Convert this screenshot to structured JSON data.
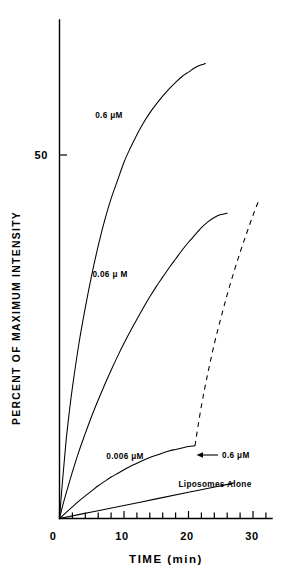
{
  "chart_data": {
    "type": "line",
    "title": "",
    "xlabel": "TIME (min)",
    "ylabel": "PERCENT OF MAXIMUM INTENSITY",
    "xlim": [
      0,
      31
    ],
    "ylim": [
      0,
      68
    ],
    "grid": false,
    "legend_position": "inline-annotations",
    "x_ticks_major": [
      0,
      10,
      20,
      30
    ],
    "x_tick_labels": [
      "0",
      "10",
      "20",
      "30"
    ],
    "x_tick_minor_step": 2,
    "y_ticks_major": [
      50
    ],
    "y_tick_labels": [
      "50"
    ],
    "series": [
      {
        "name": "0.6 uM",
        "label": "0.6 μM",
        "style": "solid",
        "x": [
          0,
          0.5,
          1,
          1.5,
          2,
          3,
          4,
          5,
          6,
          7,
          8,
          9,
          10,
          11,
          12,
          13,
          14,
          15,
          16,
          17,
          18,
          19,
          20,
          21,
          22,
          22.6
        ],
        "y": [
          0,
          5.5,
          10.5,
          14.5,
          18,
          24,
          29,
          33.5,
          37.5,
          41,
          44,
          46.5,
          49,
          51,
          52.8,
          54.4,
          55.8,
          57,
          58.1,
          59.1,
          60,
          60.8,
          61.4,
          62,
          62.4,
          62.6
        ]
      },
      {
        "name": "0.06 uM",
        "label": "0.06 μ M",
        "style": "solid",
        "x": [
          0,
          0.5,
          1,
          2,
          3,
          4,
          5,
          6,
          7,
          8,
          9,
          10,
          11,
          12,
          13,
          14,
          15,
          16,
          17,
          18,
          19,
          20,
          21,
          22,
          23,
          24,
          25,
          26
        ],
        "y": [
          0,
          1.8,
          3.4,
          6.4,
          9.2,
          11.7,
          14.1,
          16.3,
          18.4,
          20.4,
          22.3,
          24.1,
          25.8,
          27.4,
          29.0,
          30.5,
          31.9,
          33.2,
          34.5,
          35.7,
          36.9,
          38.0,
          39.0,
          40.0,
          40.8,
          41.4,
          41.8,
          42.0
        ]
      },
      {
        "name": "0.006 uM",
        "label": "0.006 μM",
        "style": "solid",
        "x": [
          0,
          1,
          2,
          3,
          4,
          5,
          6,
          7,
          8,
          9,
          10,
          11,
          12,
          13,
          14,
          15,
          16,
          17,
          18,
          19,
          20,
          21
        ],
        "y": [
          0,
          0.8,
          1.6,
          2.4,
          3.1,
          3.8,
          4.5,
          5.1,
          5.7,
          6.2,
          6.7,
          7.2,
          7.6,
          8.0,
          8.4,
          8.7,
          9.0,
          9.3,
          9.5,
          9.7,
          9.9,
          10.0
        ]
      },
      {
        "name": "Liposomes Alone",
        "label": "Liposomes Alone",
        "style": "solid",
        "x": [
          0,
          5,
          10,
          15,
          20,
          25,
          27
        ],
        "y": [
          0,
          0.9,
          1.8,
          2.7,
          3.6,
          4.5,
          4.9
        ]
      },
      {
        "name": "0.6 uM added",
        "label": "0.6 μM",
        "style": "dashed",
        "x": [
          21,
          22,
          23,
          24,
          25,
          26,
          27,
          28,
          29,
          30,
          31
        ],
        "y": [
          10.0,
          15.5,
          20.0,
          24.0,
          27.5,
          30.8,
          33.8,
          36.6,
          39.2,
          41.7,
          44.0
        ]
      }
    ],
    "annotations": [
      {
        "name": "arrow-annotation",
        "text": "0.6 μM",
        "points_to_x": 21,
        "points_to_y": 10
      }
    ]
  },
  "labels": {
    "series_0_6": "0.6 μM",
    "series_0_06": "0.06 μ M",
    "series_0_006": "0.006 μM",
    "series_liposomes": "Liposomes Alone",
    "arrow_label": "0.6 μM",
    "y_tick_50": "50",
    "x_tick_0": "0",
    "x_tick_10": "10",
    "x_tick_20": "20",
    "x_tick_30": "30",
    "x_axis_title": "TIME (min)",
    "y_axis_title": "PERCENT OF MAXIMUM INTENSITY"
  }
}
